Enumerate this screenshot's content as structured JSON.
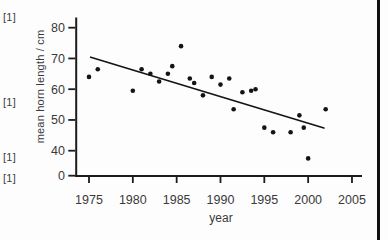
{
  "page": {
    "marks": [
      "[1]",
      "[1]",
      "[1]",
      "[1]"
    ]
  },
  "chart_data": {
    "type": "scatter",
    "title": "",
    "xlabel": "year",
    "ylabel": "mean horn length / cm",
    "x_ticks": [
      1975,
      1980,
      1985,
      1990,
      1995,
      2000,
      2005
    ],
    "y_ticks": [
      80,
      70,
      60,
      50,
      40,
      0
    ],
    "xlim": [
      1973.5,
      2006
    ],
    "ylim": [
      0,
      80
    ],
    "axis_note": "y axis compressed between 0 and 40",
    "grid": false,
    "legend": "none",
    "columns": [
      "year",
      "mean_horn_length_cm"
    ],
    "points": [
      [
        1975,
        64
      ],
      [
        1976,
        66.5
      ],
      [
        1980,
        59.5
      ],
      [
        1981,
        66.5
      ],
      [
        1982,
        65
      ],
      [
        1983,
        62.5
      ],
      [
        1984,
        65
      ],
      [
        1984.5,
        67.5
      ],
      [
        1985.5,
        74
      ],
      [
        1986.5,
        63.5
      ],
      [
        1987,
        62
      ],
      [
        1988,
        58
      ],
      [
        1989,
        64
      ],
      [
        1990,
        61.5
      ],
      [
        1991,
        63.5
      ],
      [
        1991.5,
        53.5
      ],
      [
        1992.5,
        59
      ],
      [
        1993.5,
        59.5
      ],
      [
        1994,
        60
      ],
      [
        1995,
        47.5
      ],
      [
        1996,
        46
      ],
      [
        1998,
        46
      ],
      [
        1999,
        51.5
      ],
      [
        1999.5,
        47.5
      ],
      [
        2000,
        37.5
      ],
      [
        2002,
        53.5
      ]
    ],
    "trend_line": {
      "from": {
        "year": 1975.2,
        "value": 70.4
      },
      "to": {
        "year": 2001.8,
        "value": 47.4
      }
    },
    "colors": {
      "points": "#141414",
      "trend_line": "#141414",
      "axis": "#1b1b1b",
      "text": "#3a3a3a"
    }
  }
}
